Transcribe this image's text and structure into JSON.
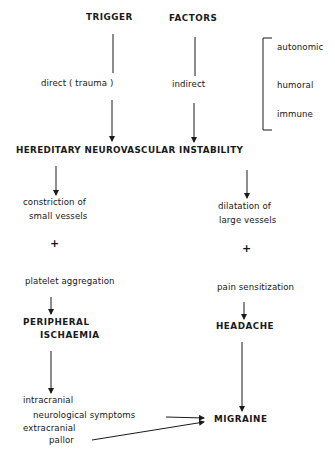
{
  "diagram": {
    "header": {
      "trigger": "TRIGGER",
      "factors": "FACTORS"
    },
    "trigger_types": {
      "direct": "direct ( trauma )",
      "indirect": "indirect"
    },
    "factor_categories": [
      "autonomic",
      "humoral",
      "immune"
    ],
    "central_node": "HEREDITARY NEUROVASCULAR INSTABILITY",
    "left_branch": {
      "step1_line1": "constriction of",
      "step1_line2": "small vessels",
      "plus": "+",
      "step2": "platelet aggregation",
      "result_line1": "PERIPHERAL",
      "result_line2": "ISCHAEMIA",
      "symptoms": {
        "intracranial": "intracranial",
        "neurological": "neurological symptoms",
        "extracranial": "extracranial",
        "pallor": "pallor"
      }
    },
    "right_branch": {
      "step1_line1": "dilatation of",
      "step1_line2": "large vessels",
      "plus": "+",
      "step2": "pain sensitization",
      "result": "HEADACHE"
    },
    "outcome": "MIGRAINE",
    "line_color": "#1a1a1a"
  }
}
